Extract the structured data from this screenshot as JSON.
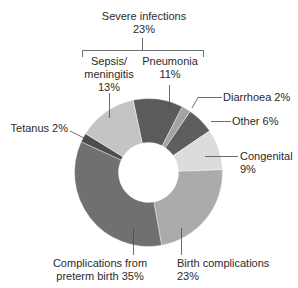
{
  "chart_data": {
    "type": "pie",
    "subtype": "donut",
    "title": "",
    "start_angle_deg": -12,
    "direction": "clockwise",
    "group": {
      "label": "Severe infections",
      "value_label": "23%",
      "members": [
        "Sepsis/ meningitis",
        "Pneumonia"
      ]
    },
    "slices": [
      {
        "name": "Pneumonia",
        "value": 11,
        "label_line1": "Pneumonia",
        "label_line2": "11%",
        "color": "#5b5b5b"
      },
      {
        "name": "Diarrhoea",
        "value": 2,
        "label_line1": "Diarrhoea 2%",
        "color": "#a3a3a3"
      },
      {
        "name": "Other",
        "value": 6,
        "label_line1": "Other 6%",
        "color": "#5e5e5e"
      },
      {
        "name": "Congenital",
        "value": 9,
        "label_line1": "Congenital",
        "label_line2": "9%",
        "color": "#dcdcdc"
      },
      {
        "name": "Birth complications",
        "value": 23,
        "label_line1": "Birth complications",
        "label_line2": "23%",
        "color": "#ababab"
      },
      {
        "name": "Complications from preterm birth",
        "value": 35,
        "label_line1": "Complications from",
        "label_line2": "preterm birth 35%",
        "color": "#707070"
      },
      {
        "name": "Tetanus",
        "value": 2,
        "label_line1": "Tetanus 2%",
        "color": "#4d4d4d"
      },
      {
        "name": "Sepsis/ meningitis",
        "value": 13,
        "label_line1": "Sepsis/",
        "label_line2": "meningitis",
        "label_line3": "13%",
        "color": "#c4c4c4"
      }
    ],
    "categories": [
      "Pneumonia",
      "Diarrhoea",
      "Other",
      "Congenital",
      "Birth complications",
      "Complications from preterm birth",
      "Tetanus",
      "Sepsis/ meningitis"
    ],
    "values": [
      11,
      2,
      6,
      9,
      23,
      35,
      2,
      13
    ],
    "legend": "none (direct labels with leader lines)"
  },
  "geometry": {
    "cx": 148.5,
    "cy": 172.5,
    "outer_r": 74,
    "inner_r": 30
  }
}
